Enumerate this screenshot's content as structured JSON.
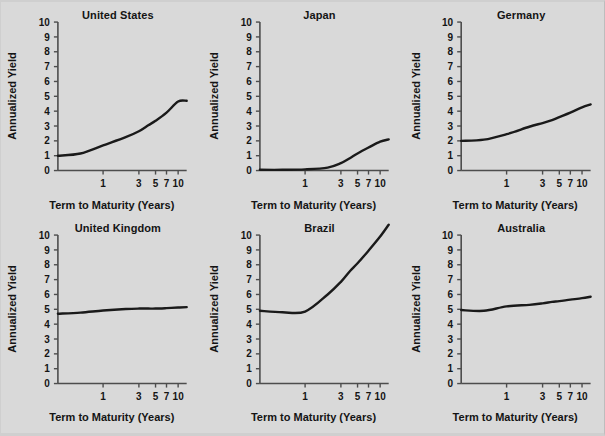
{
  "figure": {
    "background_color": "#d9d9d9",
    "line_color": "#1a1a1a",
    "axis_color": "#4d4d4d",
    "text_color": "#141414",
    "axis_label_x": "Term to Maturity (Years)",
    "axis_label_y": "Annualized Yield",
    "y_ticks": [
      "0",
      "1",
      "2",
      "3",
      "4",
      "5",
      "6",
      "7",
      "8",
      "9",
      "10"
    ],
    "x_ticks": [
      "1",
      "3",
      "5",
      "7",
      "10"
    ]
  },
  "chart_data": [
    {
      "type": "line",
      "title": "United States",
      "xlabel": "Term to Maturity (Years)",
      "ylabel": "Annualized Yield",
      "xlim": [
        0.25,
        13
      ],
      "ylim": [
        0,
        10
      ],
      "xscale": "log",
      "grid": false,
      "legend": "none",
      "xticks": [
        1,
        3,
        5,
        7,
        10
      ],
      "yticks": [
        0,
        1,
        2,
        3,
        4,
        5,
        6,
        7,
        8,
        9,
        10
      ],
      "x": [
        0.25,
        0.5,
        1,
        2,
        3,
        4,
        5,
        7,
        10,
        13
      ],
      "y": [
        1.0,
        1.15,
        1.7,
        2.25,
        2.65,
        3.05,
        3.35,
        3.9,
        4.65,
        4.7
      ]
    },
    {
      "type": "line",
      "title": "Japan",
      "xlabel": "Term to Maturity (Years)",
      "ylabel": "Annualized Yield",
      "xlim": [
        0.25,
        13
      ],
      "ylim": [
        0,
        10
      ],
      "xscale": "log",
      "grid": false,
      "legend": "none",
      "xticks": [
        1,
        3,
        5,
        7,
        10
      ],
      "yticks": [
        0,
        1,
        2,
        3,
        4,
        5,
        6,
        7,
        8,
        9,
        10
      ],
      "x": [
        0.25,
        0.5,
        1,
        2,
        3,
        4,
        5,
        7,
        10,
        13
      ],
      "y": [
        0.05,
        0.05,
        0.08,
        0.2,
        0.5,
        0.85,
        1.15,
        1.55,
        1.95,
        2.1
      ]
    },
    {
      "type": "line",
      "title": "Germany",
      "xlabel": "Term to Maturity (Years)",
      "ylabel": "Annualized Yield",
      "xlim": [
        0.25,
        13
      ],
      "ylim": [
        0,
        10
      ],
      "xscale": "log",
      "grid": false,
      "legend": "none",
      "xticks": [
        1,
        3,
        5,
        7,
        10
      ],
      "yticks": [
        0,
        1,
        2,
        3,
        4,
        5,
        6,
        7,
        8,
        9,
        10
      ],
      "x": [
        0.25,
        0.5,
        1,
        2,
        3,
        4,
        5,
        7,
        10,
        13
      ],
      "y": [
        2.0,
        2.08,
        2.45,
        2.95,
        3.2,
        3.4,
        3.6,
        3.9,
        4.25,
        4.45
      ]
    },
    {
      "type": "line",
      "title": "United Kingdom",
      "xlabel": "Term to Maturity (Years)",
      "ylabel": "Annualized Yield",
      "xlim": [
        0.25,
        13
      ],
      "ylim": [
        0,
        10
      ],
      "xscale": "log",
      "grid": false,
      "legend": "none",
      "xticks": [
        1,
        3,
        5,
        7,
        10
      ],
      "yticks": [
        0,
        1,
        2,
        3,
        4,
        5,
        6,
        7,
        8,
        9,
        10
      ],
      "x": [
        0.25,
        0.5,
        1,
        2,
        3,
        4,
        5,
        7,
        10,
        13
      ],
      "y": [
        4.7,
        4.78,
        4.92,
        5.02,
        5.05,
        5.05,
        5.05,
        5.08,
        5.12,
        5.15
      ]
    },
    {
      "type": "line",
      "title": "Brazil",
      "xlabel": "Term to Maturity (Years)",
      "ylabel": "Annualized Yield",
      "xlim": [
        0.25,
        13
      ],
      "ylim": [
        0,
        10
      ],
      "xscale": "log",
      "grid": false,
      "legend": "none",
      "xticks": [
        1,
        3,
        5,
        7,
        10
      ],
      "yticks": [
        0,
        1,
        2,
        3,
        4,
        5,
        6,
        7,
        8,
        9,
        10
      ],
      "x": [
        0.25,
        0.5,
        1,
        2,
        3,
        4,
        5,
        7,
        10,
        13
      ],
      "y": [
        4.9,
        4.8,
        4.85,
        6.0,
        6.85,
        7.6,
        8.1,
        8.95,
        9.9,
        10.7
      ]
    },
    {
      "type": "line",
      "title": "Australia",
      "xlabel": "Term to Maturity (Years)",
      "ylabel": "Annualized Yield",
      "xlim": [
        0.25,
        13
      ],
      "ylim": [
        0,
        10
      ],
      "xscale": "log",
      "grid": false,
      "legend": "none",
      "xticks": [
        1,
        3,
        5,
        7,
        10
      ],
      "yticks": [
        0,
        1,
        2,
        3,
        4,
        5,
        6,
        7,
        8,
        9,
        10
      ],
      "x": [
        0.25,
        0.5,
        1,
        2,
        3,
        4,
        5,
        7,
        10,
        13
      ],
      "y": [
        4.95,
        4.9,
        5.2,
        5.3,
        5.4,
        5.5,
        5.55,
        5.65,
        5.75,
        5.85
      ]
    }
  ]
}
